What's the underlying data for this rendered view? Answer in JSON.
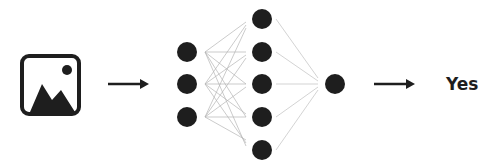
{
  "diagram": {
    "title": "",
    "input": {
      "icon": "image-icon",
      "label": ""
    },
    "network": {
      "layers": [
        {
          "name": "input-layer",
          "nodes": 3
        },
        {
          "name": "hidden-layer",
          "nodes": 5
        },
        {
          "name": "output-layer",
          "nodes": 1
        }
      ]
    },
    "output": {
      "label": "Yes"
    },
    "colors": {
      "node": "#1e1e1e",
      "edge": "#c8c8c8",
      "arrow": "#1e1e1e",
      "icon": "#1e1e1e"
    }
  }
}
